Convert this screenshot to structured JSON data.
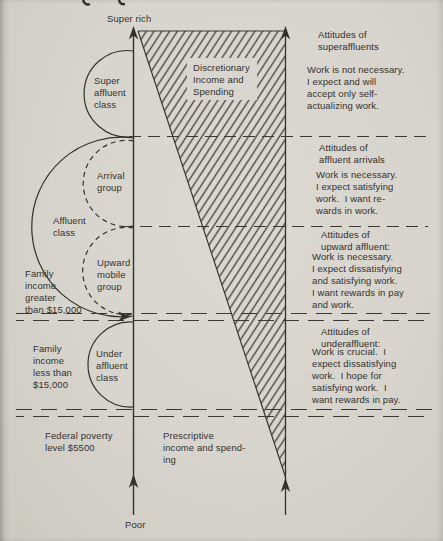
{
  "colors": {
    "paper": "#d7d4cd",
    "ink": "#35322c",
    "line": "#3b3832",
    "hatch": "#45423b"
  },
  "axis": {
    "top_label": "Super rich",
    "bottom_label": "Poor"
  },
  "classes": {
    "super_affluent": "Super\naffluent\nclass",
    "arrival": "Arrival\ngroup",
    "affluent": "Affluent\nclass",
    "upward_mobile": "Upward\nmobile\ngroup",
    "under_affluent": "Under\naffluent\nclass"
  },
  "income_labels": {
    "greater": "Family\nincome\ngreater\nthan $15,000",
    "less": "Family\nincome\nless than\n$15,000",
    "poverty": "Federal poverty\nlevel $5500"
  },
  "bands": {
    "discretionary": "Discretionary\nIncome and\nSpending",
    "prescriptive": "Prescriptive\nincome and spend-\ning"
  },
  "attitudes": [
    {
      "heading": "Attitudes of\nsuperaffluents",
      "body": "Work is not necessary.\nI expect and will\naccept only self-\nactualizing work."
    },
    {
      "heading": "Attitudes of\naffluent arrivals",
      "body": "Work is necessary.\nI expect satisfying\nwork.  I want re-\nwards in work."
    },
    {
      "heading": "Attitudes of\nupward affluent:",
      "body": "Work is necessary.\nI expect dissatisfying\nand satisfying work.\nI want rewards in pay\nand work."
    },
    {
      "heading": "Attitudes of\nunderaffluent:",
      "body": "Work is crucial.  I\nexpect dissatisfying\nwork.  I hope for\nsatisfying work.  I\nwant rewards in pay."
    }
  ]
}
